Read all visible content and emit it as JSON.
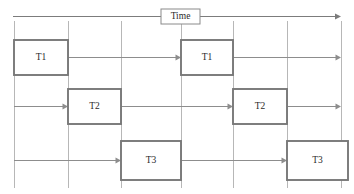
{
  "diagram": {
    "kind": "timing-diagram",
    "width": 354,
    "height": 194,
    "background_color": "#ffffff",
    "axis": {
      "label": "Time",
      "label_box_x": 161,
      "label_box_y": 9,
      "label_box_width": 39,
      "label_box_height": 15,
      "y": 16,
      "x_start": 13,
      "x_end": 341,
      "color": "#7c7c7c",
      "direction": "left-to-right"
    },
    "gridlines": {
      "color": "#b7b7b7",
      "y_top": 21,
      "y_bottom": 188,
      "x_positions": [
        14,
        68,
        121,
        181,
        233,
        287,
        341
      ]
    },
    "flow_color": "#8d8d8d",
    "task_box": {
      "fill": "#ffffff",
      "border_color": "#787878",
      "text_color": "#2b2b2b"
    },
    "rows": [
      {
        "name": "row-t1",
        "task": "T1",
        "y_top": 40,
        "y_bottom": 75,
        "y_mid": 57,
        "boxes": [
          {
            "label": "T1",
            "x_start": 14,
            "x_end": 68
          },
          {
            "label": "T1",
            "x_start": 181,
            "x_end": 233
          }
        ],
        "arrows": [
          {
            "x_start": 68,
            "x_end": 181,
            "arrowhead": true
          },
          {
            "x_start": 233,
            "x_end": 341,
            "arrowhead": true
          }
        ]
      },
      {
        "name": "row-t2",
        "task": "T2",
        "y_top": 89,
        "y_bottom": 124,
        "y_mid": 106,
        "boxes": [
          {
            "label": "T2",
            "x_start": 68,
            "x_end": 121
          },
          {
            "label": "T2",
            "x_start": 233,
            "x_end": 287
          }
        ],
        "arrows": [
          {
            "x_start": 14,
            "x_end": 68,
            "arrowhead": true
          },
          {
            "x_start": 121,
            "x_end": 233,
            "arrowhead": true
          },
          {
            "x_start": 287,
            "x_end": 341,
            "arrowhead": true
          }
        ]
      },
      {
        "name": "row-t3",
        "task": "T3",
        "y_top": 141,
        "y_bottom": 180,
        "y_mid": 160,
        "boxes": [
          {
            "label": "T3",
            "x_start": 121,
            "x_end": 181
          },
          {
            "label": "T3",
            "x_start": 287,
            "x_end": 348
          }
        ],
        "arrows": [
          {
            "x_start": 14,
            "x_end": 121,
            "arrowhead": true
          },
          {
            "x_start": 181,
            "x_end": 287,
            "arrowhead": true
          }
        ]
      }
    ]
  }
}
